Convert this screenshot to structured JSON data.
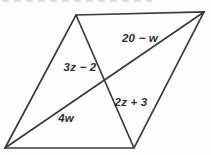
{
  "figure": {
    "type": "geometry-diagram",
    "shape": "parallelogram with both diagonals drawn",
    "labels": [
      {
        "id": "diagonal-segment-upper-right",
        "text": "20 − w"
      },
      {
        "id": "diagonal-segment-upper-left",
        "text": "3z − 2"
      },
      {
        "id": "diagonal-segment-lower-right",
        "text": "2z + 3"
      },
      {
        "id": "diagonal-segment-lower-left",
        "text": "4w"
      }
    ],
    "colors": {
      "line": "#3a3a3a",
      "text": "#2e2e2e",
      "background": "#fefefe"
    }
  }
}
